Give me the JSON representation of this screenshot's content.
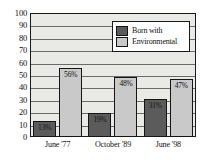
{
  "chart_data": {
    "type": "bar",
    "title": "",
    "xlabel": "",
    "ylabel": "",
    "ylim": [
      0,
      100
    ],
    "ytick_step": 10,
    "yticks": [
      "100",
      "90",
      "80",
      "70",
      "60",
      "50",
      "40",
      "30",
      "20",
      "10",
      "0"
    ],
    "grid": true,
    "legend_position": "top-right-inside",
    "categories": [
      "June '77",
      "October '89",
      "June '98"
    ],
    "series": [
      {
        "name": "Born with",
        "color": "#5b5b5b",
        "values": [
          13,
          19,
          31
        ],
        "labels": [
          "13%",
          "19%",
          "31%"
        ]
      },
      {
        "name": "Environmental",
        "color": "#c9c9c9",
        "values": [
          56,
          48,
          47
        ],
        "labels": [
          "56%",
          "48%",
          "47%"
        ]
      }
    ]
  },
  "legend": {
    "items": [
      {
        "label": "Born with",
        "color": "#5b5b5b"
      },
      {
        "label": "Environmental",
        "color": "#c9c9c9"
      }
    ]
  },
  "colors": {
    "plot_background": "#e9e9e6",
    "page_background": "#ffffff",
    "axis": "#1a1a1a",
    "gridline": "#6b6b6b",
    "born_with": "#5b5b5b",
    "environmental": "#c9c9c9"
  }
}
